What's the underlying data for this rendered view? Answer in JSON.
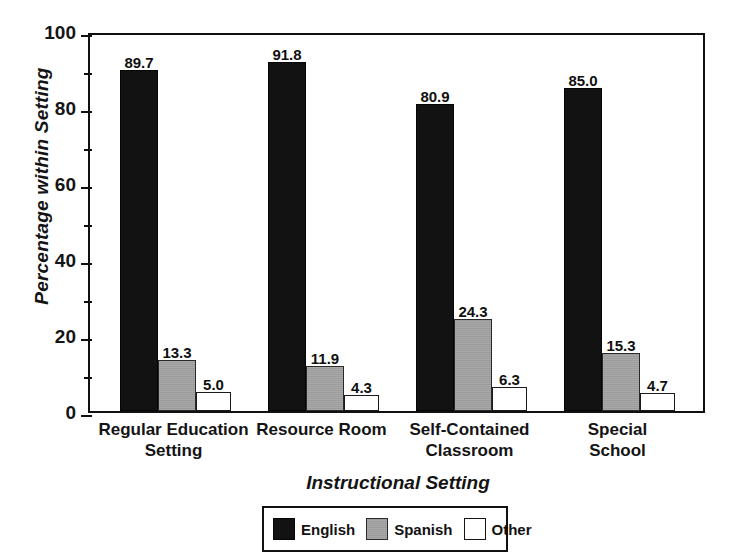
{
  "chart_data": {
    "type": "bar",
    "title": "",
    "xlabel": "Instructional Setting",
    "ylabel": "Percentage within Setting",
    "ylim": [
      0,
      100
    ],
    "yticks": [
      0,
      20,
      40,
      60,
      80,
      100
    ],
    "yminorticks": [
      10,
      30,
      50,
      70,
      90
    ],
    "grid": false,
    "legend_position": "bottom-center",
    "categories": [
      "Regular Education\nSetting",
      "Resource Room",
      "Self-Contained\nClassroom",
      "Special School"
    ],
    "series": [
      {
        "name": "English",
        "color": "#121212",
        "values": [
          89.7,
          91.8,
          80.9,
          85.0
        ]
      },
      {
        "name": "Spanish",
        "color": "#9b9b9b",
        "values": [
          13.3,
          11.9,
          24.3,
          15.3
        ]
      },
      {
        "name": "Other",
        "color": "#ffffff",
        "values": [
          5.0,
          4.3,
          6.3,
          4.7
        ]
      }
    ],
    "value_labels": [
      [
        "89.7",
        "91.8",
        "80.9",
        "85.0"
      ],
      [
        "13.3",
        "11.9",
        "24.3",
        "15.3"
      ],
      [
        "5.0",
        "4.3",
        "6.3",
        "4.7"
      ]
    ],
    "ytick_labels": [
      "0",
      "20",
      "40",
      "60",
      "80",
      "100"
    ]
  },
  "legend": {
    "items": [
      {
        "label": "English"
      },
      {
        "label": "Spanish"
      },
      {
        "label": "Other"
      }
    ]
  }
}
